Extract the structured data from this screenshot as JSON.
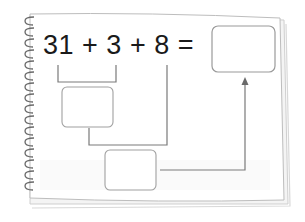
{
  "worksheet": {
    "equation": {
      "term1": "31",
      "op1": "+",
      "term2": "3",
      "op2": "+",
      "term3": "8",
      "equals": "="
    },
    "boxes": {
      "answer_box": "",
      "step1_box": "",
      "step2_box": ""
    }
  },
  "colors": {
    "page": "#ffffff",
    "page_shadow": "#d9d9d9",
    "line": "#8a8a8a",
    "box_border": "#9a9a9a",
    "spiral": "#6a6a6a",
    "text": "#1a1a1a"
  }
}
